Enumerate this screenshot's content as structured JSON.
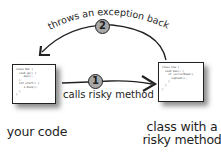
{
  "diagram": {
    "top_arrow": {
      "step": "2",
      "label": "throws an exception back"
    },
    "middle_arrow": {
      "step": "1",
      "label": "calls risky method"
    },
    "left_node": {
      "label": "your code",
      "code": "class Bar {\n  void go() {\n     moo();\n  }\n  int stuff() {\n     x.beep();\n  }\n}"
    },
    "right_node": {
      "label_line1": "class with a",
      "label_line2": "risky method",
      "code": "class Cow {\n  void moo() {\n    if (serverDown){\n      explode();\n    }\n  }\n}"
    },
    "colors": {
      "line": "#222222",
      "badge_fill": "#a8a8a8",
      "background": "#ffffff"
    }
  }
}
